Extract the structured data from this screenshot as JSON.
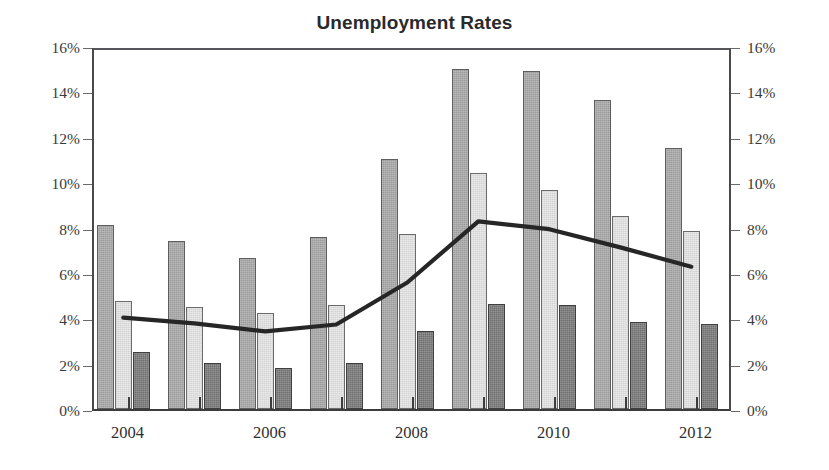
{
  "chart": {
    "title": "Unemployment Rates"
  },
  "axes": {
    "y_left": {
      "labels": [
        "16%",
        "14%",
        "12%",
        "10%",
        "8%",
        "6%",
        "4%",
        "2%",
        "0%"
      ],
      "values": [
        16,
        14,
        12,
        10,
        8,
        6,
        4,
        2,
        0
      ]
    },
    "y_right": {
      "labels": [
        "16%",
        "14%",
        "12%",
        "10%",
        "8%",
        "6%",
        "4%",
        "2%",
        "0%"
      ],
      "values": [
        16,
        14,
        12,
        10,
        8,
        6,
        4,
        2,
        0
      ]
    },
    "x": {
      "labels": [
        "2004",
        "2006",
        "2008",
        "2010",
        "2012"
      ],
      "values": [
        2004,
        2006,
        2008,
        2010,
        2012
      ]
    }
  },
  "chart_data": {
    "type": "bar",
    "title": "Unemployment Rates",
    "xlabel": "",
    "ylabel": "",
    "ylim": [
      0,
      16
    ],
    "ytick_values": [
      0,
      2,
      4,
      6,
      8,
      10,
      12,
      14,
      16
    ],
    "ytick_labels": [
      "0%",
      "2%",
      "4%",
      "6%",
      "8%",
      "10%",
      "12%",
      "14%",
      "16%"
    ],
    "dual_axis": true,
    "grid": false,
    "legend": "none",
    "categories": [
      "2004",
      "2005",
      "2006",
      "2007",
      "2008",
      "2009",
      "2010",
      "2011",
      "2012"
    ],
    "xtick_labels_shown": [
      "2004",
      "2006",
      "2008",
      "2010",
      "2012"
    ],
    "series": [
      {
        "name": "series-1",
        "style": "bar",
        "color": "#9c9c9c",
        "values": [
          8.1,
          7.4,
          6.65,
          7.6,
          11.0,
          15.0,
          14.9,
          13.6,
          11.5
        ]
      },
      {
        "name": "series-2",
        "style": "bar",
        "color": "#e9e9e9",
        "values": [
          4.75,
          4.5,
          4.25,
          4.6,
          7.7,
          10.4,
          9.65,
          8.5,
          7.85
        ]
      },
      {
        "name": "series-3",
        "style": "bar",
        "color": "#6f6f6f",
        "values": [
          2.5,
          2.05,
          1.8,
          2.05,
          3.45,
          4.65,
          4.6,
          3.85,
          3.75
        ]
      },
      {
        "name": "series-4",
        "style": "line",
        "color": "#262626",
        "values": [
          4.2,
          3.95,
          3.6,
          3.9,
          5.75,
          8.45,
          8.1,
          7.3,
          6.45
        ]
      }
    ]
  }
}
